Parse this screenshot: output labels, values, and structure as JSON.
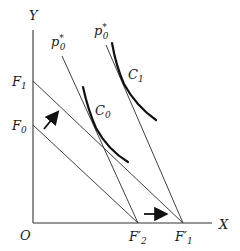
{
  "diagram": {
    "axes": {
      "x_label": "X",
      "y_label": "Y",
      "origin_label": "O"
    },
    "intercepts": {
      "y": [
        {
          "id": "F1",
          "label": "F",
          "sub": "1"
        },
        {
          "id": "F0",
          "label": "F",
          "sub": "0"
        }
      ],
      "x": [
        {
          "id": "F2p",
          "label": "F′",
          "sub": "2"
        },
        {
          "id": "F1p",
          "label": "F′",
          "sub": "1"
        }
      ]
    },
    "price_lines": [
      {
        "label": "p",
        "sup": "*",
        "sub": "0"
      },
      {
        "label": "p",
        "sup": "*",
        "sub": "0"
      }
    ],
    "curves": [
      {
        "label": "C",
        "sub": "0"
      },
      {
        "label": "C",
        "sub": "1"
      }
    ],
    "arrows": [
      "budget-shift-up-arrow",
      "intercept-shift-right-arrow"
    ]
  }
}
